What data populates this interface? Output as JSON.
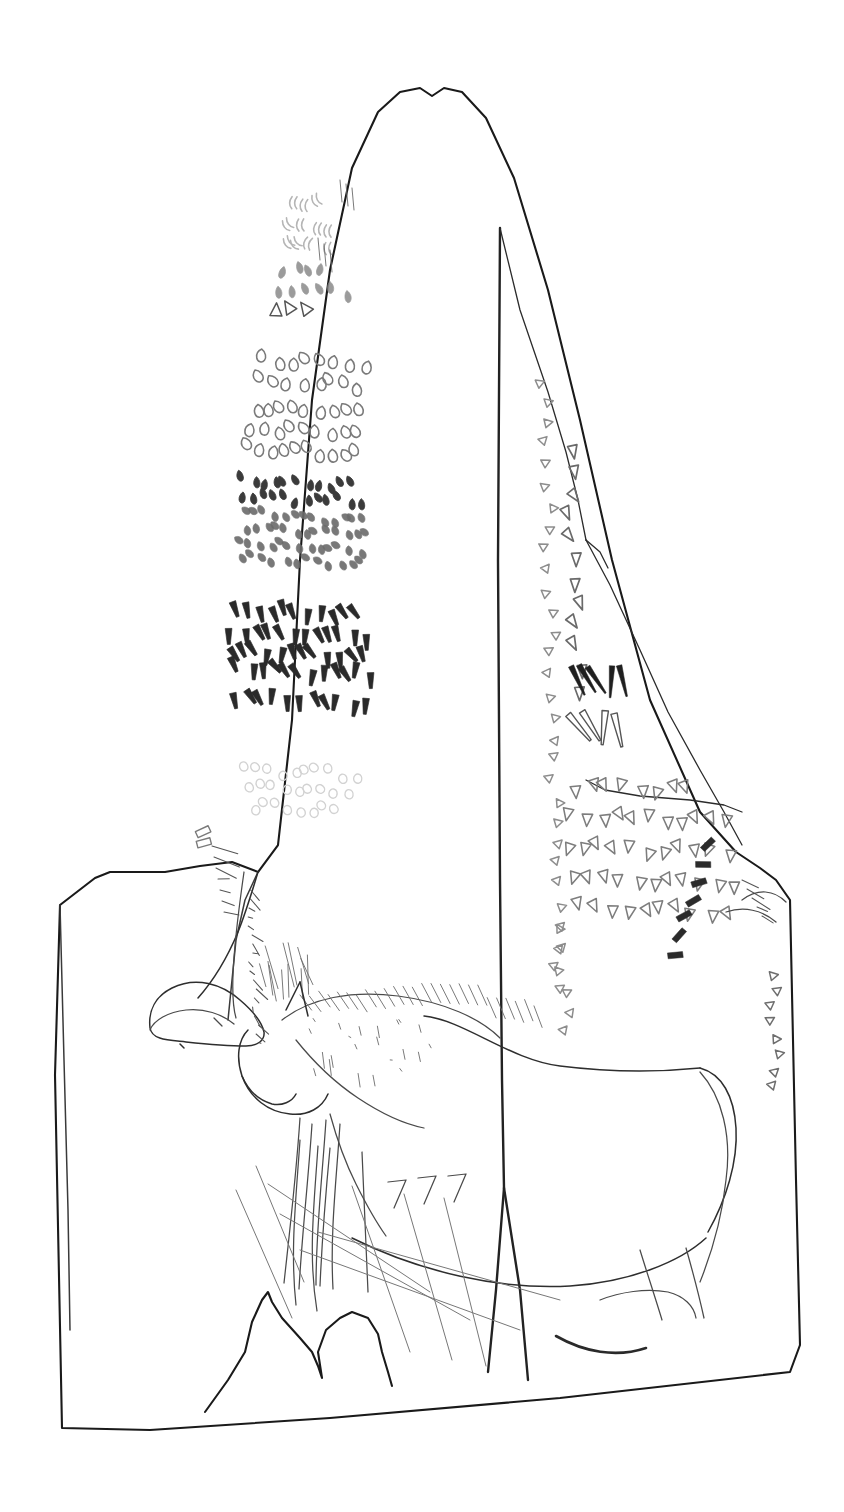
{
  "figure": {
    "background_color": "#ffffff",
    "ink_color": "#1a1a1a",
    "faint_ink_color": "#b9b9b9"
  },
  "slab": {
    "name": "stone-slab-outline",
    "outline_path": "M 62,1428 L 55,1075 L 60,905 L 95,878 L 110,872 L 165,872 L 200,866 L 232,862 L 258,872 L 278,845 L 292,720 L 300,560 L 312,400 L 330,270 L 352,168 L 378,112 L 400,92 L 420,88 L 432,96 L 444,88 L 462,92 L 486,118 L 514,178 L 548,290 L 580,420 L 612,560 L 650,700 L 700,812 L 736,852 L 760,868 L 776,880 L 790,900 L 796,1180 L 800,1345 L 790,1372 L 560,1398 L 330,1418 L 150,1430 Z",
    "bottom_notch_path": "M 205,1412 L 228,1380 L 245,1352 L 252,1322 L 262,1300 L 268,1292 L 272,1302 L 282,1318 L 300,1338 L 312,1352 L 318,1366 L 322,1378 L 318,1352 L 326,1330 L 340,1318 L 352,1312 L 368,1318 L 378,1334 L 382,1352 L 388,1372 L 392,1386"
  },
  "fracture_lines": {
    "name": "fracture-and-facet-lines",
    "main_vertical_crack": "M 500,228 L 498,560 L 500,880 L 502,1080 L 504,1188 L 496,1290 L 488,1372",
    "crack_fork": "M 504,1188 L 520,1290 L 528,1380",
    "right_facet_upper": "M 500,228 L 520,310 L 548,392 L 566,452 L 578,500 L 586,540",
    "right_facet_lower": "M 586,540 L 610,585 L 640,650 L 668,712 L 700,770 L 724,812 L 742,845",
    "facet_step": "M 586,540 L 600,552 L 608,568",
    "facet_shelf": "M 586,780 L 605,790 L 640,796 L 690,800 L 724,805 L 742,812",
    "left_facet": "M 258,872 L 245,900 L 236,940 L 232,980 L 228,1020",
    "left_edge_interior": "M 60,905 L 64,1060 L 68,1210 L 70,1330"
  },
  "mark_groups": [
    {
      "name": "crescent-marks-top",
      "style": "faint-crescent",
      "color": "#b5b5b5",
      "row_count": 3,
      "rows": [
        {
          "y": 205,
          "x_start": 292,
          "count": 3,
          "spacing": 13
        },
        {
          "y": 228,
          "x_start": 290,
          "count": 4,
          "spacing": 13
        },
        {
          "y": 248,
          "x_start": 288,
          "count": 4,
          "spacing": 13
        }
      ]
    },
    {
      "name": "teardrop-marks-upper",
      "style": "teardrop",
      "color": "#8a8a8a",
      "rows": [
        {
          "y": 272,
          "x_start": 284,
          "count": 4,
          "spacing": 14
        },
        {
          "y": 292,
          "x_start": 280,
          "count": 6,
          "spacing": 14
        }
      ]
    },
    {
      "name": "arrow-cluster",
      "style": "mixed-arrow",
      "color": "#555555",
      "rows": [
        {
          "y": 312,
          "x_start": 278,
          "count": 3,
          "spacing": 16
        }
      ]
    },
    {
      "name": "oval-rows-main",
      "style": "oval-outline",
      "color": "#7a7a7a",
      "row_count": 5,
      "rows": [
        {
          "y": 362,
          "x_start": 268,
          "count": 8,
          "spacing": 14
        },
        {
          "y": 383,
          "x_start": 264,
          "count": 8,
          "spacing": 14
        },
        {
          "y": 408,
          "x_start": 258,
          "count": 9,
          "spacing": 13
        },
        {
          "y": 430,
          "x_start": 254,
          "count": 9,
          "spacing": 13
        },
        {
          "y": 450,
          "x_start": 250,
          "count": 10,
          "spacing": 12
        }
      ]
    },
    {
      "name": "dark-dot-rows",
      "style": "filled-dot",
      "color": "#3b3b3b",
      "rows": [
        {
          "y": 482,
          "x_start": 244,
          "count": 11,
          "spacing": 11
        },
        {
          "y": 498,
          "x_start": 242,
          "count": 12,
          "spacing": 11
        }
      ]
    },
    {
      "name": "slanted-comma-rows",
      "style": "slanted-comma",
      "color": "#6a6a6a",
      "rows": [
        {
          "y": 516,
          "x_start": 246,
          "count": 13,
          "spacing": 10
        },
        {
          "y": 530,
          "x_start": 248,
          "count": 13,
          "spacing": 10
        },
        {
          "y": 546,
          "x_start": 242,
          "count": 13,
          "spacing": 10
        },
        {
          "y": 560,
          "x_start": 244,
          "count": 12,
          "spacing": 11
        }
      ]
    },
    {
      "name": "dark-wedge-block",
      "style": "dark-wedge",
      "color": "#2a2a2a",
      "row_count": 5,
      "rows": [
        {
          "y": 612,
          "x_start": 238,
          "count": 11,
          "spacing": 12
        },
        {
          "y": 634,
          "x_start": 234,
          "count": 12,
          "spacing": 12
        },
        {
          "y": 654,
          "x_start": 232,
          "count": 12,
          "spacing": 12
        },
        {
          "y": 672,
          "x_start": 240,
          "count": 12,
          "spacing": 12
        },
        {
          "y": 702,
          "x_start": 236,
          "count": 11,
          "spacing": 13
        }
      ]
    },
    {
      "name": "faint-circle-rows",
      "style": "faint-circle",
      "color": "#d2d2d2",
      "row_count": 3,
      "rows": [
        {
          "y": 772,
          "x_start": 248,
          "count": 10,
          "spacing": 12
        },
        {
          "y": 790,
          "x_start": 252,
          "count": 9,
          "spacing": 12
        },
        {
          "y": 808,
          "x_start": 254,
          "count": 8,
          "spacing": 12
        }
      ]
    },
    {
      "name": "right-panel-left-column",
      "style": "small-triangle",
      "color": "#8d8d8d",
      "orientation": "vertical-column",
      "x_base": 548,
      "y_start": 382,
      "count": 30,
      "spacing": 21
    },
    {
      "name": "right-panel-inner-column",
      "style": "triangle-pennant",
      "color": "#6a6a6a",
      "orientation": "vertical-column",
      "x_base": 574,
      "y_start": 452,
      "count": 12,
      "spacing": 22
    },
    {
      "name": "dark-vertical-strokes",
      "style": "dark-taper",
      "color": "#1f1f1f",
      "x_start": 578,
      "y": 682,
      "count": 5,
      "spacing": 11
    },
    {
      "name": "outline-taper-strokes",
      "style": "outline-taper",
      "color": "#555555",
      "x_start": 580,
      "y": 730,
      "count": 4,
      "spacing": 13
    },
    {
      "name": "pennant-rows-right",
      "style": "pennant",
      "color": "#7d7d7d",
      "row_count": 5,
      "rows": [
        {
          "y": 790,
          "x_start": 578,
          "count": 8,
          "spacing": 16
        },
        {
          "y": 820,
          "x_start": 572,
          "count": 11,
          "spacing": 16
        },
        {
          "y": 850,
          "x_start": 570,
          "count": 11,
          "spacing": 16
        },
        {
          "y": 880,
          "x_start": 576,
          "count": 11,
          "spacing": 16
        },
        {
          "y": 910,
          "x_start": 584,
          "count": 10,
          "spacing": 16
        }
      ]
    },
    {
      "name": "lower-left-triangle-column",
      "style": "small-triangle",
      "color": "#8d8d8d",
      "orientation": "vertical-column",
      "x_base": 566,
      "y_start": 930,
      "count": 6,
      "spacing": 21
    },
    {
      "name": "diagonal-dark-bar-row",
      "style": "dark-bar",
      "color": "#2b2b2b",
      "x_start": 712,
      "y_start": 848,
      "count": 7,
      "dx": -6,
      "dy": 18
    },
    {
      "name": "right-edge-triangle-column",
      "style": "small-triangle",
      "color": "#6e6e6e",
      "orientation": "vertical-column",
      "x_base": 775,
      "y_start": 976,
      "count": 8,
      "spacing": 16
    },
    {
      "name": "small-rect-marks-left",
      "style": "rectangle",
      "color": "#7a7a7a",
      "x": 206,
      "y": 832,
      "count": 2,
      "spacing": 11
    }
  ],
  "animals": [
    {
      "name": "bovid-head-left",
      "label": "animal figure — head and neck with horn (left)",
      "body_path": "M 150,1028 C 148,1010 156,996 172,988 C 196,976 222,984 240,1000 C 254,1012 262,1022 264,1032 C 265,1040 258,1046 246,1046 C 228,1046 205,1044 186,1042 C 168,1040 152,1040 150,1028 Z",
      "horn_path": "M 258,872 C 252,892 246,912 238,932 C 228,956 214,980 198,998",
      "neck_path": "M 244,872 C 240,900 236,930 234,958 C 232,984 232,1004 236,1018",
      "jaw_path": "M 150,1030 C 154,1020 168,1012 186,1010 C 204,1008 222,1014 234,1024",
      "eye_mark": "M 214,1018 L 222,1026",
      "muzzle_tick": "M 180,1044 L 184,1048"
    },
    {
      "name": "horse-figure-main",
      "label": "horse figure with mane, body, legs and tail",
      "back_path": "M 424,1016 C 464,1020 510,1060 560,1066 C 608,1072 660,1072 700,1068",
      "belly_path": "M 352,1238 C 420,1272 500,1290 570,1286 C 630,1282 680,1262 706,1238",
      "rump_path": "M 700,1068 C 722,1074 734,1096 736,1128 C 738,1162 726,1200 708,1232",
      "tail_path": "M 700,1072 C 722,1096 732,1136 726,1180 C 722,1218 712,1252 700,1282",
      "head_path": "M 248,1030 C 238,1040 236,1058 242,1076 C 250,1098 268,1112 290,1114 C 308,1116 322,1108 328,1094",
      "muzzle_path": "M 242,1076 C 248,1090 258,1100 272,1104 C 282,1106 292,1102 296,1094",
      "neck_path": "M 296,1040 C 312,1060 334,1082 358,1098 C 382,1114 404,1124 424,1128",
      "mane_path": "M 282,1020 C 310,998 352,990 398,996 C 444,1002 480,1018 500,1038",
      "chest_path": "M 330,1114 C 336,1136 344,1160 356,1184 C 366,1204 376,1222 386,1236",
      "foreleg_a": "M 330,1148 C 326,1190 322,1240 320,1286",
      "foreleg_b": "M 362,1152 C 364,1196 366,1244 368,1292",
      "hindleg_a": "M 640,1250 C 648,1276 656,1300 662,1320",
      "hindleg_b": "M 686,1248 C 694,1276 700,1300 704,1318",
      "hoof_path": "M 600,1300 C 620,1292 646,1288 668,1292 C 684,1296 694,1306 696,1318",
      "dark_hoof_stroke": "M 556,1336 C 584,1352 616,1358 646,1348"
    }
  ],
  "stroke_bundles": [
    {
      "name": "left-shoulder-hatching",
      "count": 7,
      "x": 212,
      "y": 846,
      "dx": 22,
      "dy": 8,
      "step_y": 11
    },
    {
      "name": "neck-hatching-left-animal",
      "count": 18,
      "x": 250,
      "y": 890,
      "len": 16,
      "step_y": 9
    },
    {
      "name": "mane-hatching",
      "count": 26,
      "x": 300,
      "y": 990,
      "step_x": 12,
      "len": 26
    },
    {
      "name": "mane-fill-ticks",
      "count": 22,
      "x": 312,
      "y": 1032,
      "step_x": 13,
      "len": 12
    },
    {
      "name": "lower-scratches",
      "count": 9,
      "description": "long oblique scratch lines crossing the horse's legs"
    }
  ]
}
